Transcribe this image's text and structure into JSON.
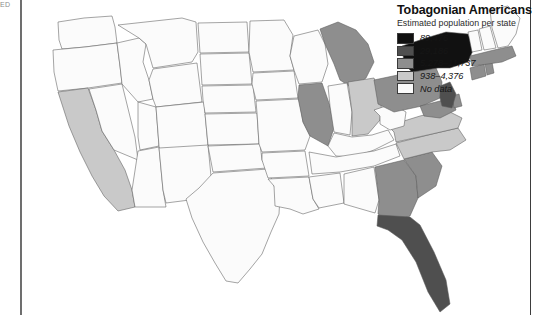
{
  "page": {
    "gutter_note": "ED",
    "background": "#ffffff"
  },
  "legend": {
    "title": "Tobagonian Americans",
    "subtitle": "Estimated population per state",
    "items": [
      {
        "label": "89,476",
        "color": "#111111"
      },
      {
        "label": "29,186",
        "color": "#4f4f4f"
      },
      {
        "label": "5,278–11,737",
        "color": "#8e8e8e"
      },
      {
        "label": "938–4,376",
        "color": "#c9c9c9"
      },
      {
        "label": "No data",
        "color": "#fbfbfb"
      }
    ]
  },
  "chart_data": {
    "type": "choropleth",
    "title": "Tobagonian Americans",
    "subtitle": "Estimated population per state",
    "region": "United States",
    "legend_position": "top-right",
    "grid": false,
    "bins": [
      {
        "label": "89,476",
        "color": "#111111",
        "min": 89476,
        "max": 89476
      },
      {
        "label": "29,186",
        "color": "#4f4f4f",
        "min": 29186,
        "max": 29186
      },
      {
        "label": "5,278–11,737",
        "color": "#8e8e8e",
        "min": 5278,
        "max": 11737
      },
      {
        "label": "938–4,376",
        "color": "#c9c9c9",
        "min": 938,
        "max": 4376
      },
      {
        "label": "No data",
        "color": "#fbfbfb",
        "min": null,
        "max": null
      }
    ],
    "states": [
      {
        "code": "WA",
        "bin": 4
      },
      {
        "code": "OR",
        "bin": 4
      },
      {
        "code": "CA",
        "bin": 3
      },
      {
        "code": "ID",
        "bin": 4
      },
      {
        "code": "NV",
        "bin": 4
      },
      {
        "code": "UT",
        "bin": 4
      },
      {
        "code": "AZ",
        "bin": 4
      },
      {
        "code": "MT",
        "bin": 4
      },
      {
        "code": "WY",
        "bin": 4
      },
      {
        "code": "CO",
        "bin": 4
      },
      {
        "code": "NM",
        "bin": 4
      },
      {
        "code": "ND",
        "bin": 4
      },
      {
        "code": "SD",
        "bin": 4
      },
      {
        "code": "NE",
        "bin": 4
      },
      {
        "code": "KS",
        "bin": 4
      },
      {
        "code": "OK",
        "bin": 4
      },
      {
        "code": "TX",
        "bin": 4
      },
      {
        "code": "MN",
        "bin": 4
      },
      {
        "code": "IA",
        "bin": 4
      },
      {
        "code": "MO",
        "bin": 4
      },
      {
        "code": "AR",
        "bin": 4
      },
      {
        "code": "LA",
        "bin": 4
      },
      {
        "code": "WI",
        "bin": 4
      },
      {
        "code": "IL",
        "bin": 2
      },
      {
        "code": "MI",
        "bin": 2
      },
      {
        "code": "IN",
        "bin": 4
      },
      {
        "code": "OH",
        "bin": 3
      },
      {
        "code": "KY",
        "bin": 4
      },
      {
        "code": "TN",
        "bin": 4
      },
      {
        "code": "MS",
        "bin": 4
      },
      {
        "code": "AL",
        "bin": 4
      },
      {
        "code": "GA",
        "bin": 2
      },
      {
        "code": "FL",
        "bin": 1
      },
      {
        "code": "SC",
        "bin": 2
      },
      {
        "code": "NC",
        "bin": 3
      },
      {
        "code": "VA",
        "bin": 3
      },
      {
        "code": "WV",
        "bin": 4
      },
      {
        "code": "PA",
        "bin": 2
      },
      {
        "code": "NY",
        "bin": 0
      },
      {
        "code": "MD",
        "bin": 2
      },
      {
        "code": "DE",
        "bin": 2
      },
      {
        "code": "NJ",
        "bin": 1
      },
      {
        "code": "CT",
        "bin": 2
      },
      {
        "code": "RI",
        "bin": 2
      },
      {
        "code": "MA",
        "bin": 2
      },
      {
        "code": "VT",
        "bin": 4
      },
      {
        "code": "NH",
        "bin": 4
      },
      {
        "code": "ME",
        "bin": 4
      }
    ]
  }
}
